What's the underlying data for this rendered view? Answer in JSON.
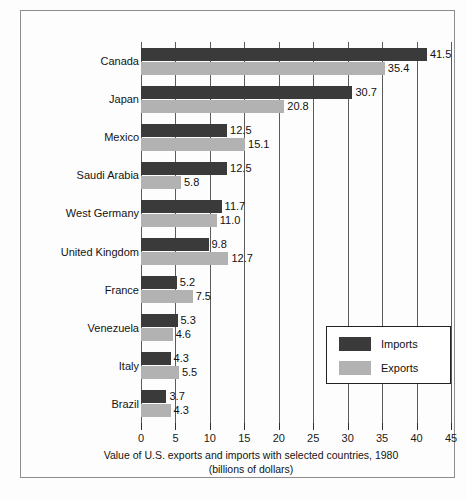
{
  "chart_data": {
    "type": "bar",
    "orientation": "horizontal",
    "title": "",
    "caption_line1": "Value of U.S. exports and imports with selected countries, 1980",
    "caption_line2": "(billions of dollars)",
    "xlabel": "",
    "ylabel": "",
    "xlim": [
      0,
      45
    ],
    "xticks": [
      0,
      5,
      10,
      15,
      20,
      25,
      30,
      35,
      40,
      45
    ],
    "xtick_labels": [
      "0",
      "5",
      "10",
      "15",
      "20",
      "25",
      "30",
      "35",
      "40",
      "45"
    ],
    "grid": true,
    "grid_axis": "x",
    "legend_position": "lower-right",
    "categories": [
      "Canada",
      "Japan",
      "Mexico",
      "Saudi Arabia",
      "West Germany",
      "United Kingdom",
      "France",
      "Venezuela",
      "Italy",
      "Brazil"
    ],
    "series": [
      {
        "name": "Imports",
        "color": "#3a3a3a",
        "values": [
          41.5,
          30.7,
          12.5,
          12.5,
          11.7,
          9.8,
          5.2,
          5.3,
          4.3,
          3.7
        ],
        "labels": [
          "41.5",
          "30.7",
          "12.5",
          "12.5",
          "11.7",
          "9.8",
          "5.2",
          "5.3",
          "4.3",
          "3.7"
        ]
      },
      {
        "name": "Exports",
        "color": "#b2b2b2",
        "values": [
          35.4,
          20.8,
          15.1,
          5.8,
          11.0,
          12.7,
          7.5,
          4.6,
          5.5,
          4.3
        ],
        "labels": [
          "35.4",
          "20.8",
          "15.1",
          "5.8",
          "11.0",
          "12.7",
          "7.5",
          "4.6",
          "5.5",
          "4.3"
        ]
      }
    ]
  },
  "legend": {
    "items": [
      {
        "label": "Imports",
        "color": "#3a3a3a"
      },
      {
        "label": "Exports",
        "color": "#b2b2b2"
      }
    ]
  }
}
